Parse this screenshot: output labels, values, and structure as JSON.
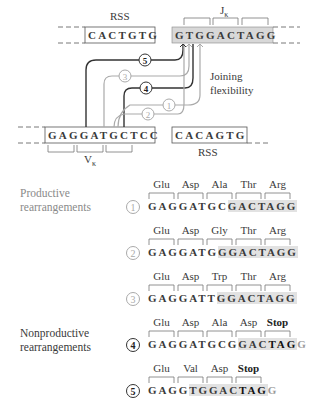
{
  "diagram": {
    "top": {
      "rss_left": {
        "label": "RSS",
        "sequence": "CACTGTG"
      },
      "j_segment": {
        "label": "J",
        "subscript": "κ",
        "sequence": "GTGGACTAGG"
      },
      "joining_label": [
        "Joining",
        "flexibility"
      ],
      "v_segment": {
        "label": "V",
        "subscript": "κ",
        "sequence": "GAGGATGCTCC"
      },
      "rss_right": {
        "label": "RSS",
        "sequence": "CACAGTG"
      },
      "paths": [
        {
          "id": "5",
          "style": "dark"
        },
        {
          "id": "3",
          "style": "light"
        },
        {
          "id": "4",
          "style": "dark"
        },
        {
          "id": "1",
          "style": "light"
        },
        {
          "id": "2",
          "style": "light"
        }
      ]
    },
    "productive": {
      "label_line1": "Productive",
      "label_line2": "rearrangements",
      "rows": [
        {
          "id": "1",
          "codons": [
            "Glu",
            "Asp",
            "Ala",
            "Thr",
            "Arg"
          ],
          "plain": "GAGGATGC",
          "shaded": "GACTAGG",
          "bold_stop": "",
          "tail": ""
        },
        {
          "id": "2",
          "codons": [
            "Glu",
            "Asp",
            "Gly",
            "Thr",
            "Arg"
          ],
          "plain": "GAGGATG",
          "shaded": "GGACTAGG",
          "bold_stop": "",
          "tail": ""
        },
        {
          "id": "3",
          "codons": [
            "Glu",
            "Asp",
            "Trp",
            "Thr",
            "Arg"
          ],
          "plain": "GAGGATT",
          "shaded": "GGACTAGG",
          "bold_stop": "",
          "tail": ""
        }
      ]
    },
    "nonproductive": {
      "label_line1": "Nonproductive",
      "label_line2": "rearrangements",
      "rows": [
        {
          "id": "4",
          "codons": [
            "Glu",
            "Asp",
            "Ala",
            "Asp",
            "Stop"
          ],
          "plain": "GAGGATGCG",
          "shaded": "GAC",
          "bold_stop": "TAG",
          "tail": "G"
        },
        {
          "id": "5",
          "codons": [
            "Glu",
            "Val",
            "Asp",
            "Stop"
          ],
          "plain": "GAGG",
          "shaded": "TGGAC",
          "bold_stop": "TAG",
          "tail": "G"
        }
      ]
    }
  }
}
